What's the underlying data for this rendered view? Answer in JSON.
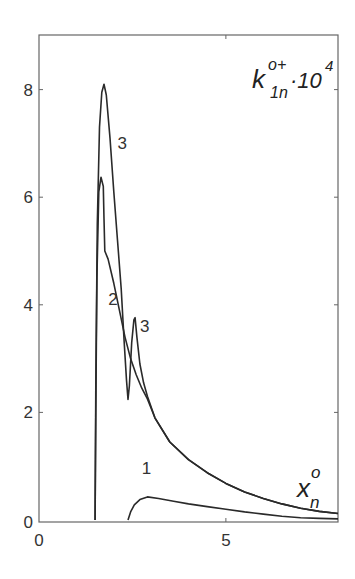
{
  "chart_data": {
    "type": "line",
    "title_parts": {
      "base": "k",
      "sup": "o+",
      "sub": "1n",
      "suffix": "·10",
      "suffix_sup": "4"
    },
    "xlabel": "x_n^o",
    "xlabel_parts": {
      "base": "x",
      "sup": "o",
      "sub": "n"
    },
    "ylabel": "",
    "xlim": [
      0,
      8
    ],
    "ylim": [
      0,
      9
    ],
    "x_ticks": [
      0,
      5
    ],
    "x_tick_labels": [
      "0",
      "5"
    ],
    "y_ticks": [
      0,
      2,
      4,
      6,
      8
    ],
    "y_tick_labels": [
      "0",
      "2",
      "4",
      "6",
      "8"
    ],
    "grid": false,
    "legend": "none (curves labeled inline 1, 2, 3)",
    "series": [
      {
        "name": "1",
        "points": [
          [
            2.38,
            0
          ],
          [
            2.45,
            0.15
          ],
          [
            2.55,
            0.28
          ],
          [
            2.7,
            0.38
          ],
          [
            2.9,
            0.43
          ],
          [
            3.2,
            0.4
          ],
          [
            3.6,
            0.35
          ],
          [
            4.0,
            0.3
          ],
          [
            4.5,
            0.25
          ],
          [
            5.0,
            0.2
          ],
          [
            5.5,
            0.15
          ],
          [
            6.0,
            0.11
          ],
          [
            6.5,
            0.07
          ],
          [
            7.0,
            0.04
          ],
          [
            7.5,
            0.03
          ],
          [
            8.0,
            0.02
          ]
        ]
      },
      {
        "name": "2",
        "points": [
          [
            1.5,
            0
          ],
          [
            1.52,
            2.0
          ],
          [
            1.55,
            4.5
          ],
          [
            1.6,
            6.1
          ],
          [
            1.66,
            6.37
          ],
          [
            1.72,
            6.2
          ],
          [
            1.74,
            5.6
          ],
          [
            1.76,
            5.0
          ],
          [
            1.85,
            4.85
          ],
          [
            2.0,
            4.4
          ],
          [
            2.15,
            3.9
          ],
          [
            2.3,
            3.4
          ],
          [
            2.45,
            3.0
          ],
          [
            2.6,
            2.7
          ],
          [
            2.75,
            2.45
          ],
          [
            2.9,
            2.25
          ],
          [
            3.1,
            1.9
          ],
          [
            3.5,
            1.45
          ],
          [
            4.0,
            1.12
          ],
          [
            4.5,
            0.88
          ],
          [
            5.0,
            0.68
          ],
          [
            5.5,
            0.52
          ],
          [
            6.0,
            0.4
          ],
          [
            6.5,
            0.3
          ],
          [
            7.0,
            0.22
          ],
          [
            7.5,
            0.16
          ],
          [
            8.0,
            0.12
          ]
        ]
      },
      {
        "name": "3",
        "points": [
          [
            1.5,
            0
          ],
          [
            1.52,
            2.5
          ],
          [
            1.56,
            5.5
          ],
          [
            1.62,
            7.3
          ],
          [
            1.68,
            7.95
          ],
          [
            1.74,
            8.1
          ],
          [
            1.8,
            7.9
          ],
          [
            1.9,
            7.1
          ],
          [
            2.0,
            6.1
          ],
          [
            2.1,
            5.2
          ],
          [
            2.2,
            4.3
          ],
          [
            2.28,
            3.3
          ],
          [
            2.34,
            2.6
          ],
          [
            2.38,
            2.24
          ],
          [
            2.42,
            2.5
          ],
          [
            2.48,
            3.3
          ],
          [
            2.54,
            3.72
          ],
          [
            2.57,
            3.76
          ],
          [
            2.62,
            3.4
          ],
          [
            2.7,
            2.9
          ],
          [
            2.8,
            2.55
          ],
          [
            2.9,
            2.3
          ],
          [
            3.1,
            1.9
          ],
          [
            3.5,
            1.45
          ],
          [
            4.0,
            1.12
          ],
          [
            4.5,
            0.88
          ],
          [
            5.0,
            0.68
          ],
          [
            5.5,
            0.52
          ],
          [
            6.0,
            0.4
          ],
          [
            6.5,
            0.3
          ],
          [
            7.0,
            0.22
          ],
          [
            7.5,
            0.16
          ],
          [
            8.0,
            0.12
          ]
        ]
      }
    ],
    "annotations": [
      {
        "text": "3",
        "x": 2.1,
        "y": 6.9
      },
      {
        "text": "2",
        "x": 1.85,
        "y": 4.0
      },
      {
        "text": "3",
        "x": 2.7,
        "y": 3.5
      },
      {
        "text": "1",
        "x": 2.75,
        "y": 0.85
      }
    ]
  },
  "colors": {
    "line": "#2a2a2a",
    "axis": "#555555",
    "background": "#ffffff"
  }
}
